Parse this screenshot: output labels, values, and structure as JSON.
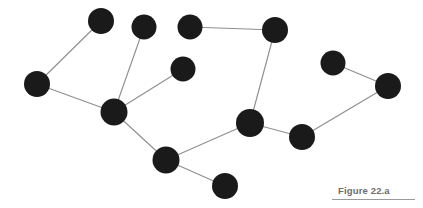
{
  "figure": {
    "caption": "Figure 22.a",
    "background_color": "#ffffff",
    "node_color": "#1a1a1a",
    "edge_color": "#8f8f8f",
    "caption_color": "#6d6d6d",
    "rule_color": "#9a9a9a",
    "width": 423,
    "height": 208
  },
  "chart_data": {
    "type": "scatter",
    "title": "Figure 22.a",
    "subtitle": "",
    "xlabel": "",
    "ylabel": "",
    "xlim": [
      0,
      423
    ],
    "ylim": [
      208,
      0
    ],
    "grid": false,
    "legend": false,
    "node_radius": 12.5,
    "nodes": [
      {
        "id": "n1",
        "x": 101,
        "y": 21,
        "r": 13
      },
      {
        "id": "n2",
        "x": 144,
        "y": 27,
        "r": 12.5
      },
      {
        "id": "n3",
        "x": 190,
        "y": 27,
        "r": 12.5
      },
      {
        "id": "n4",
        "x": 275,
        "y": 30,
        "r": 13
      },
      {
        "id": "n5",
        "x": 37,
        "y": 84,
        "r": 13
      },
      {
        "id": "n6",
        "x": 183,
        "y": 69,
        "r": 12.5
      },
      {
        "id": "n7",
        "x": 333,
        "y": 63,
        "r": 12.5
      },
      {
        "id": "n8",
        "x": 388,
        "y": 86,
        "r": 13
      },
      {
        "id": "n9",
        "x": 114,
        "y": 112,
        "r": 13.5
      },
      {
        "id": "n10",
        "x": 250,
        "y": 123,
        "r": 14
      },
      {
        "id": "n11",
        "x": 302,
        "y": 137,
        "r": 13
      },
      {
        "id": "n12",
        "x": 166,
        "y": 160,
        "r": 13.5
      },
      {
        "id": "n13",
        "x": 225,
        "y": 186,
        "r": 13
      }
    ],
    "edges": [
      {
        "source": "n5",
        "target": "n1"
      },
      {
        "source": "n5",
        "target": "n9"
      },
      {
        "source": "n2",
        "target": "n9"
      },
      {
        "source": "n9",
        "target": "n6"
      },
      {
        "source": "n3",
        "target": "n4"
      },
      {
        "source": "n4",
        "target": "n10"
      },
      {
        "source": "n7",
        "target": "n8"
      },
      {
        "source": "n8",
        "target": "n11"
      },
      {
        "source": "n11",
        "target": "n10"
      },
      {
        "source": "n10",
        "target": "n12"
      },
      {
        "source": "n9",
        "target": "n12"
      },
      {
        "source": "n12",
        "target": "n13"
      }
    ]
  }
}
